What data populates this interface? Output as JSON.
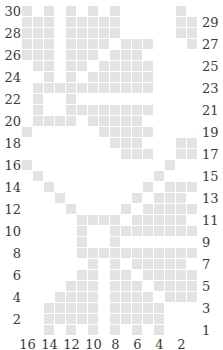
{
  "grid": {
    "columns": 16,
    "rows": 30,
    "cell_color": "#e3e3e3",
    "filled": {
      "30": [
        16,
        14,
        12,
        10,
        8,
        2
      ],
      "29": [
        16,
        15,
        14,
        12,
        11,
        10,
        9,
        8,
        2,
        1
      ],
      "28": [
        16,
        15,
        14,
        12,
        11,
        10,
        9,
        8,
        2,
        1
      ],
      "27": [
        16,
        15,
        14,
        12,
        11,
        10,
        9,
        7,
        6,
        5,
        1
      ],
      "26": [
        16,
        15,
        14,
        12,
        11,
        10,
        8,
        7,
        6
      ],
      "25": [
        15,
        14,
        12,
        11,
        9,
        8,
        7,
        6,
        5
      ],
      "24": [
        14,
        12,
        10,
        9,
        8,
        7,
        6,
        5
      ],
      "23": [
        15,
        14,
        13,
        12,
        11,
        10,
        9,
        8,
        7,
        6,
        5
      ],
      "22": [
        15,
        12
      ],
      "21": [
        15,
        12,
        11,
        10,
        9,
        8,
        7,
        6,
        5
      ],
      "20": [
        15,
        14,
        13,
        12,
        10,
        9,
        8,
        7,
        6
      ],
      "19": [
        16,
        9,
        8,
        7,
        6,
        5
      ],
      "18": [
        8,
        7,
        6,
        2,
        1
      ],
      "17": [
        7,
        6,
        5,
        2,
        1
      ],
      "16": [
        16,
        3
      ],
      "15": [
        15,
        4
      ],
      "14": [
        14,
        5,
        3,
        2,
        1
      ],
      "13": [
        13,
        6,
        4,
        3,
        2
      ],
      "12": [
        12,
        7,
        5,
        4,
        3,
        2,
        1
      ],
      "11": [
        11,
        10,
        9,
        8,
        6,
        5,
        4,
        3,
        2
      ],
      "10": [
        11,
        8,
        7,
        6,
        5,
        4,
        3,
        2,
        1
      ],
      "9": [
        11,
        8
      ],
      "8": [
        11,
        10,
        9,
        8,
        7,
        6,
        5,
        4,
        3,
        2,
        1
      ],
      "7": [
        10,
        8,
        6,
        5,
        4,
        3,
        2
      ],
      "6": [
        11,
        10,
        8,
        7,
        5,
        4,
        3,
        2,
        1
      ],
      "5": [
        12,
        11,
        10,
        8,
        7,
        6,
        4,
        3,
        2,
        1
      ],
      "4": [
        13,
        12,
        11,
        10,
        8,
        7,
        6,
        5,
        3,
        2,
        1
      ],
      "3": [
        14,
        13,
        12,
        11,
        10,
        8,
        7,
        6,
        5,
        4
      ],
      "2": [
        14,
        13,
        12,
        11,
        10,
        8,
        7,
        6,
        5,
        4
      ],
      "1": [
        14,
        12,
        10,
        8,
        6,
        4
      ]
    }
  },
  "labels": {
    "left_rows": [
      "30",
      "28",
      "26",
      "24",
      "22",
      "20",
      "18",
      "16",
      "14",
      "12",
      "10",
      "8",
      "6",
      "4",
      "2"
    ],
    "right_rows": [
      "29",
      "27",
      "25",
      "23",
      "21",
      "19",
      "17",
      "15",
      "13",
      "11",
      "9",
      "7",
      "5",
      "3",
      "1"
    ],
    "bottom_cols": [
      "16",
      "14",
      "12",
      "10",
      "8",
      "6",
      "4",
      "2"
    ]
  }
}
